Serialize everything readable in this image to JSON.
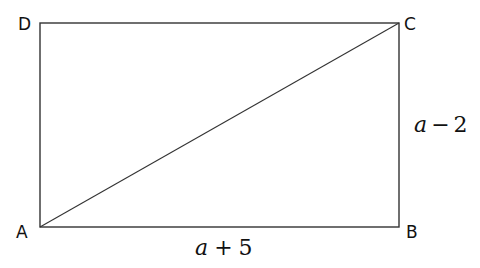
{
  "diagram": {
    "type": "rectangle-with-diagonal",
    "vertices": {
      "A": {
        "label": "A",
        "x": 40,
        "y": 227
      },
      "B": {
        "label": "B",
        "x": 399,
        "y": 227
      },
      "C": {
        "label": "C",
        "x": 399,
        "y": 23
      },
      "D": {
        "label": "D",
        "x": 40,
        "y": 23
      }
    },
    "diagonal": {
      "from": "A",
      "to": "C"
    },
    "side_labels": {
      "AB": {
        "var": "a",
        "op": "+",
        "num": "5",
        "text": "a + 5"
      },
      "BC": {
        "var": "a",
        "op": "−",
        "num": "2",
        "text": "a − 2"
      }
    },
    "colors": {
      "stroke": "#333333",
      "text": "#111111",
      "background": "#ffffff"
    }
  }
}
